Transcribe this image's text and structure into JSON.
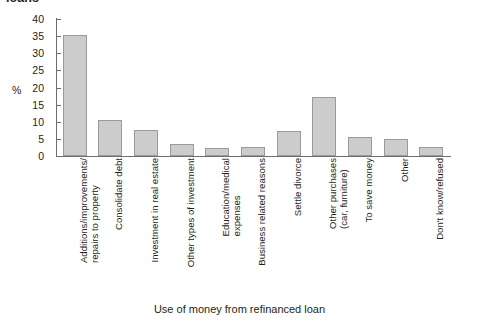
{
  "figure": {
    "clipped_title": "loans",
    "y_axis_unit_label": "%",
    "x_axis_title": "Use of money from refinanced loan"
  },
  "chart_data": {
    "type": "bar",
    "title": "loans",
    "xlabel": "Use of money from refinanced loan",
    "ylabel": "%",
    "ylim": [
      0,
      40
    ],
    "yticks": [
      0,
      5,
      10,
      15,
      20,
      25,
      30,
      35,
      40
    ],
    "grid": false,
    "legend": null,
    "bar_color": "#cccccc",
    "bar_border_color": "#9a9a9a",
    "axis_color": "#6d6e71",
    "categories": [
      "Additions/improvements/\nrepairs to property",
      "Consolidate debt",
      "Investment in real estate",
      "Other types of investment",
      "Education/medical\nexpenses",
      "Business related reasons",
      "Settle divorce",
      "Other purchases\n(car, furniture)",
      "To save money",
      "Other",
      "Don't know/refused"
    ],
    "values": [
      35.3,
      10.6,
      7.6,
      3.6,
      2.3,
      2.6,
      7.3,
      17.2,
      5.5,
      5.0,
      2.6
    ]
  }
}
